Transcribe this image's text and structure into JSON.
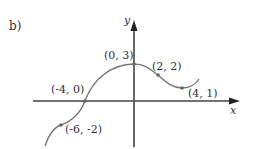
{
  "part_label": "b)",
  "axes": {
    "x_label": "x",
    "y_label": "y"
  },
  "points": [
    {
      "label": "(0, 3)",
      "x": 0,
      "y": 3
    },
    {
      "label": "(2, 2)",
      "x": 2,
      "y": 2
    },
    {
      "label": "(4, 1)",
      "x": 4,
      "y": 1
    },
    {
      "label": "(-4, 0)",
      "x": -4,
      "y": 0
    },
    {
      "label": "(-6, -2)",
      "x": -6,
      "y": -2
    }
  ],
  "colors": {
    "axis": "#333333",
    "curve": "#777777",
    "point": "#666666"
  }
}
